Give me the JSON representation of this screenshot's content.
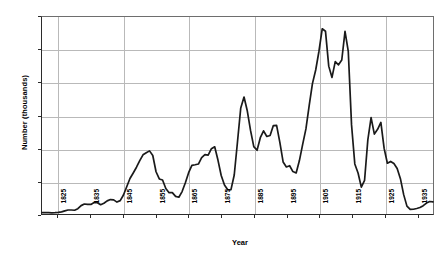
{
  "chart_data": {
    "type": "line",
    "title": "",
    "subtitle": "",
    "xlabel": "Year",
    "ylabel": "Number (thousands)",
    "xlim": [
      1820,
      1940
    ],
    "ylim": [
      0,
      1200
    ],
    "grid": true,
    "legend": null,
    "y_ticks": [
      0,
      200,
      400,
      600,
      800,
      1000,
      1200
    ],
    "y_tick_labels": [
      "0",
      "200",
      "400",
      "600",
      "800",
      "1000",
      "1200"
    ],
    "x_ticks": [
      1825,
      1835,
      1845,
      1855,
      1865,
      1875,
      1885,
      1895,
      1905,
      1915,
      1925,
      1935
    ],
    "x_tick_labels": [
      "1825",
      "1835",
      "1845",
      "1855",
      "1865",
      "1875",
      "1885",
      "1895",
      "1905",
      "1915",
      "1925",
      "1935"
    ],
    "series": [
      {
        "name": "Number (thousands)",
        "color": "#1a1a1a",
        "x": [
          1820,
          1821,
          1822,
          1823,
          1824,
          1825,
          1826,
          1827,
          1828,
          1829,
          1830,
          1831,
          1832,
          1833,
          1834,
          1835,
          1836,
          1837,
          1838,
          1839,
          1840,
          1841,
          1842,
          1843,
          1844,
          1845,
          1846,
          1847,
          1848,
          1849,
          1850,
          1851,
          1852,
          1853,
          1854,
          1855,
          1856,
          1857,
          1858,
          1859,
          1860,
          1861,
          1862,
          1863,
          1864,
          1865,
          1866,
          1867,
          1868,
          1869,
          1870,
          1871,
          1872,
          1873,
          1874,
          1875,
          1876,
          1877,
          1878,
          1879,
          1880,
          1881,
          1882,
          1883,
          1884,
          1885,
          1886,
          1887,
          1888,
          1889,
          1890,
          1891,
          1892,
          1893,
          1894,
          1895,
          1896,
          1897,
          1898,
          1899,
          1900,
          1901,
          1902,
          1903,
          1904,
          1905,
          1906,
          1907,
          1908,
          1909,
          1910,
          1911,
          1912,
          1913,
          1914,
          1915,
          1916,
          1917,
          1918,
          1919,
          1920,
          1921,
          1922,
          1923,
          1924,
          1925,
          1926,
          1927,
          1928,
          1929,
          1930,
          1931,
          1932,
          1933,
          1934,
          1935,
          1936,
          1937,
          1938,
          1939,
          1940
        ],
        "values": [
          8,
          10,
          7,
          7,
          8,
          10,
          11,
          19,
          28,
          23,
          23,
          23,
          61,
          59,
          65,
          46,
          77,
          80,
          39,
          69,
          85,
          81,
          105,
          53,
          79,
          115,
          155,
          240,
          230,
          300,
          310,
          380,
          372,
          369,
          428,
          200,
          201,
          252,
          124,
          121,
          154,
          92,
          92,
          132,
          191,
          248,
          319,
          299,
          283,
          353,
          387,
          321,
          405,
          460,
          313,
          228,
          170,
          141,
          138,
          178,
          457,
          669,
          789,
          603,
          519,
          395,
          334,
          490,
          546,
          444,
          455,
          560,
          580,
          440,
          285,
          259,
          343,
          231,
          229,
          312,
          449,
          488,
          649,
          857,
          813,
          1026,
          1101,
          1285,
          783,
          752,
          1041,
          878,
          838,
          1198,
          1218,
          327,
          299,
          295,
          110,
          141,
          430,
          805,
          310,
          523,
          707,
          294,
          304,
          335,
          307,
          280,
          242,
          97,
          36,
          23,
          29,
          35,
          36,
          50,
          67,
          83,
          71
        ]
      }
    ],
    "smoothed_values_note": "Curve is a smoothed/decadal-rendered line; plotted shape follows annual immigration totals in thousands."
  },
  "axes": {
    "y_title": "Number (thousands)",
    "x_title": "Year"
  }
}
